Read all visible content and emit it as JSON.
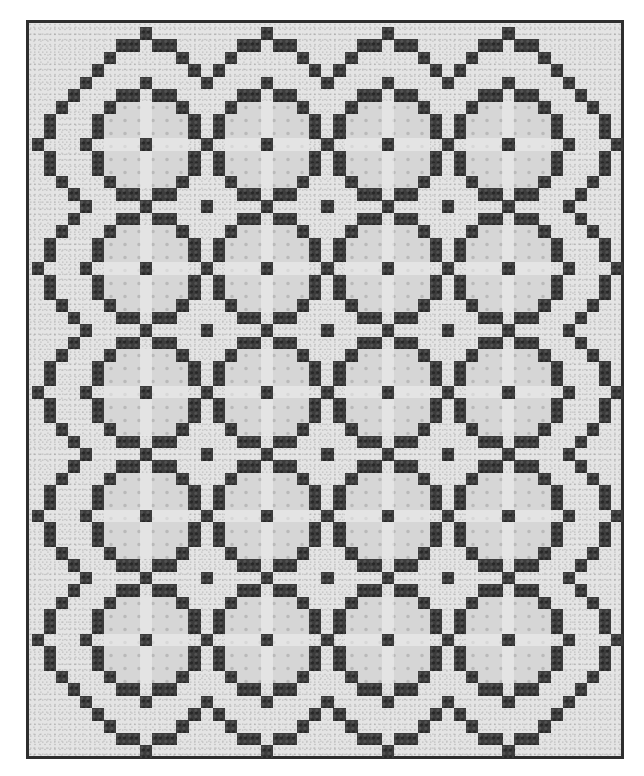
{
  "image": {
    "subject": "Photograph of a pieced quilt with a repeating circle pattern of dark squares on a light speckled background",
    "palette": {
      "background": "#ffffff",
      "light_fabric": "#e4e4e4",
      "circle_fill_fabric": "#d6d6d6",
      "dark_fabric": "#3c3c3c",
      "binding": "#2e2e2e"
    }
  },
  "quilt": {
    "bounds": {
      "left": 26,
      "top": 20,
      "right": 624,
      "bottom": 759
    },
    "grid_origin": {
      "x": 28.5,
      "y": 24
    },
    "unit": {
      "w": 12.07,
      "h": 12.38
    },
    "circle_columns": 4,
    "circle_rows": 5,
    "period_units": 10,
    "first_center_cell": {
      "col": 9,
      "row": 9
    },
    "inner_ring_cells": [
      [
        0,
        0
      ],
      [
        0,
        -5
      ],
      [
        0,
        5
      ],
      [
        -5,
        0
      ],
      [
        5,
        0
      ],
      [
        -2,
        -4
      ],
      [
        -1,
        -4
      ],
      [
        1,
        -4
      ],
      [
        2,
        -4
      ],
      [
        -2,
        4
      ],
      [
        -1,
        4
      ],
      [
        1,
        4
      ],
      [
        2,
        4
      ],
      [
        -4,
        -2
      ],
      [
        -4,
        -1
      ],
      [
        -4,
        1
      ],
      [
        -4,
        2
      ],
      [
        4,
        -2
      ],
      [
        4,
        -1
      ],
      [
        4,
        1
      ],
      [
        4,
        2
      ],
      [
        -3,
        -3
      ],
      [
        3,
        -3
      ],
      [
        -3,
        3
      ],
      [
        3,
        3
      ],
      [
        -5,
        -5
      ],
      [
        5,
        -5
      ],
      [
        -5,
        5
      ],
      [
        5,
        5
      ]
    ],
    "edge_top_cells": [
      [
        0,
        -9
      ],
      [
        -2,
        -8
      ],
      [
        -1,
        -8
      ],
      [
        1,
        -8
      ],
      [
        2,
        -8
      ],
      [
        -3,
        -7
      ],
      [
        3,
        -7
      ],
      [
        -4,
        -6
      ],
      [
        4,
        -6
      ]
    ],
    "edge_bottom_cells": [
      [
        0,
        9
      ],
      [
        -2,
        8
      ],
      [
        -1,
        8
      ],
      [
        1,
        8
      ],
      [
        2,
        8
      ],
      [
        -3,
        7
      ],
      [
        3,
        7
      ],
      [
        -4,
        6
      ],
      [
        4,
        6
      ]
    ],
    "edge_left_cells": [
      [
        -9,
        0
      ],
      [
        -8,
        -2
      ],
      [
        -8,
        -1
      ],
      [
        -8,
        1
      ],
      [
        -8,
        2
      ],
      [
        -7,
        -3
      ],
      [
        -7,
        3
      ],
      [
        -6,
        -4
      ],
      [
        -6,
        4
      ]
    ],
    "edge_right_cells": [
      [
        9,
        0
      ],
      [
        8,
        -2
      ],
      [
        8,
        -1
      ],
      [
        8,
        1
      ],
      [
        8,
        2
      ],
      [
        7,
        -3
      ],
      [
        7,
        3
      ],
      [
        6,
        -4
      ],
      [
        6,
        4
      ]
    ]
  }
}
